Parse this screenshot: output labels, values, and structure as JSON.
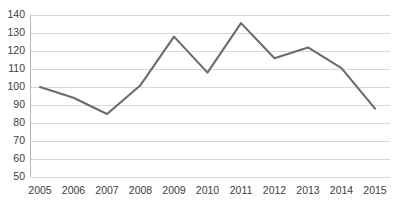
{
  "chart_data": {
    "type": "line",
    "title": "",
    "subtitle": "",
    "xlabel": "",
    "ylabel": "",
    "categories": [
      "2005",
      "2006",
      "2007",
      "2008",
      "2009",
      "2010",
      "2011",
      "2012",
      "2013",
      "2014",
      "2015"
    ],
    "values": [
      100,
      94,
      85,
      101,
      128,
      108,
      135.5,
      116,
      122,
      110.5,
      88
    ],
    "series": [
      {
        "name": "Index",
        "values": [
          100,
          94,
          85,
          101,
          128,
          108,
          135.5,
          116,
          122,
          110.5,
          88
        ]
      }
    ],
    "ylim": [
      50,
      140
    ],
    "ytick_labels": [
      "50",
      "60",
      "70",
      "80",
      "90",
      "100",
      "110",
      "120",
      "130",
      "140"
    ],
    "ytick_values": [
      50,
      60,
      70,
      80,
      90,
      100,
      110,
      120,
      130,
      140
    ],
    "xtick_labels": [
      "2005",
      "2006",
      "2007",
      "2008",
      "2009",
      "2010",
      "2011",
      "2012",
      "2013",
      "2014",
      "2015"
    ],
    "grid": "horizontal",
    "legend": "none",
    "annotations": [],
    "colors": {
      "series_line": "#6b6b6b",
      "gridline": "#d9d9d9",
      "axis_line": "#b3b3b3",
      "tick_label": "#404040",
      "background": "#ffffff"
    }
  }
}
